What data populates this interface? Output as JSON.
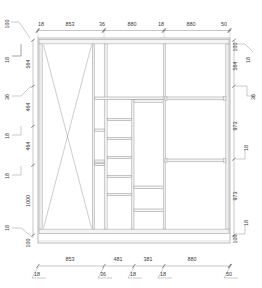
{
  "drawing": {
    "type": "cabinet-elevation",
    "units": "mm",
    "top_dimensions": {
      "segments": [
        {
          "label": "18"
        },
        {
          "label": "853"
        },
        {
          "label": "36"
        },
        {
          "label": "880"
        },
        {
          "label": "18"
        },
        {
          "label": "880"
        },
        {
          "label": "50"
        }
      ]
    },
    "bottom_dimensions": {
      "segments": [
        {
          "label": "853"
        },
        {
          "label": "481"
        },
        {
          "label": "381"
        },
        {
          "label": "880"
        }
      ],
      "tick_labels": [
        {
          "label": "18"
        },
        {
          "label": "36"
        },
        {
          "label": "18"
        },
        {
          "label": "18"
        },
        {
          "label": "50"
        }
      ]
    },
    "left_dimensions": {
      "outer": [
        {
          "label": "100"
        },
        {
          "label": "18"
        },
        {
          "label": "36"
        },
        {
          "label": "18"
        },
        {
          "label": "18"
        },
        {
          "label": "18"
        }
      ],
      "inner": [
        {
          "label": "564"
        },
        {
          "label": "464"
        },
        {
          "label": "464"
        },
        {
          "label": "1000"
        },
        {
          "label": "100"
        }
      ]
    },
    "right_dimensions": {
      "inner": [
        {
          "label": "100"
        },
        {
          "label": "564"
        },
        {
          "label": "973"
        },
        {
          "label": "973"
        },
        {
          "label": "100"
        }
      ],
      "outer": [
        {
          "label": "18"
        },
        {
          "label": "36"
        },
        {
          "label": "18"
        },
        {
          "label": "18"
        }
      ]
    }
  }
}
